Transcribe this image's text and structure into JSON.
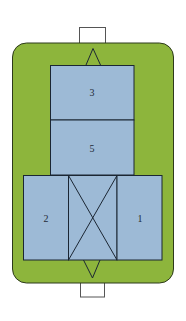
{
  "diagram": {
    "colors": {
      "outer_fill": "#8db53c",
      "outer_stroke": "#2d3a1c",
      "box_fill": "#9dbad6",
      "box_stroke": "#1b2633",
      "connector_stroke": "#555555"
    },
    "labels": {
      "box_3": "3",
      "box_5": "5",
      "box_2": "2",
      "box_1": "1"
    },
    "elements": [
      {
        "id": "connector-top",
        "type": "rect"
      },
      {
        "id": "outer-frame",
        "type": "rounded-rect"
      },
      {
        "id": "box-3",
        "label": "3"
      },
      {
        "id": "box-5",
        "label": "5"
      },
      {
        "id": "box-2",
        "label": "2"
      },
      {
        "id": "box-cross",
        "label": ""
      },
      {
        "id": "box-1",
        "label": "1"
      },
      {
        "id": "arrow-up",
        "type": "triangle"
      },
      {
        "id": "arrow-down",
        "type": "triangle"
      },
      {
        "id": "connector-bottom",
        "type": "rect"
      }
    ]
  }
}
